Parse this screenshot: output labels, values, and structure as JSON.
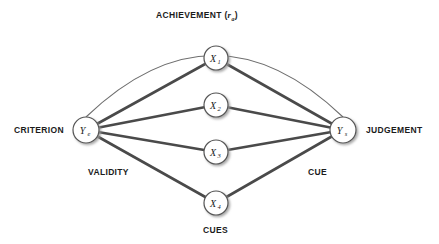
{
  "figure": {
    "background_color": "#ffffff",
    "line_color": "#4a4a4a",
    "thin_line_color": "#6b6b6b",
    "node_fill": "#ffffff",
    "node_stroke": "#555555",
    "text_color": "#1b1b1b"
  },
  "labels": {
    "achievement_prefix": "ACHIEVEMENT (",
    "achievement_symbol": "r",
    "achievement_subscript": "a",
    "achievement_suffix": ")",
    "achievement_full": "ACHIEVEMENT (ra)",
    "criterion": "CRITERION",
    "judgement": "JUDGEMENT",
    "validity": "VALIDITY",
    "cue": "CUE",
    "cues": "CUES"
  },
  "nodes": {
    "criterion": {
      "symbol": "Y",
      "subscript": "e",
      "label": "Ye",
      "cx": 86,
      "cy": 130,
      "r": 13
    },
    "judgement": {
      "symbol": "Y",
      "subscript": "s",
      "label": "Ys",
      "cx": 343,
      "cy": 130,
      "r": 13
    },
    "cues": [
      {
        "symbol": "X",
        "subscript": "1",
        "label": "X1",
        "cx": 216,
        "cy": 58,
        "r": 12
      },
      {
        "symbol": "X",
        "subscript": "2",
        "label": "X2",
        "cx": 216,
        "cy": 105,
        "r": 12
      },
      {
        "symbol": "X",
        "subscript": "3",
        "label": "X3",
        "cx": 216,
        "cy": 152,
        "r": 12
      },
      {
        "symbol": "X",
        "subscript": "4",
        "label": "X4",
        "cx": 216,
        "cy": 203,
        "r": 12
      }
    ]
  },
  "edges": {
    "achievement_arc": {
      "from": "criterion",
      "to": "judgement",
      "peak_y": 30,
      "style": "thin-arc"
    },
    "validity_links": [
      {
        "from": "criterion",
        "to": "X1"
      },
      {
        "from": "criterion",
        "to": "X2"
      },
      {
        "from": "criterion",
        "to": "X3"
      },
      {
        "from": "criterion",
        "to": "X4"
      }
    ],
    "cue_links": [
      {
        "from": "X1",
        "to": "judgement"
      },
      {
        "from": "X2",
        "to": "judgement"
      },
      {
        "from": "X3",
        "to": "judgement"
      },
      {
        "from": "X4",
        "to": "judgement"
      }
    ]
  }
}
